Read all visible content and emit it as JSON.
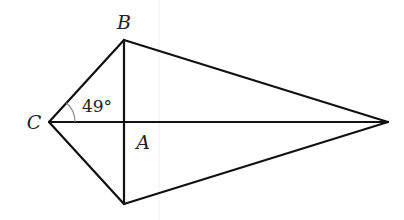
{
  "diagram": {
    "type": "kite",
    "vertices": {
      "B": {
        "label": "B",
        "x": 124,
        "y": 40
      },
      "C": {
        "label": "C",
        "x": 49,
        "y": 122
      },
      "D": {
        "label": "",
        "x": 124,
        "y": 204
      },
      "E": {
        "label": "",
        "x": 388,
        "y": 122
      },
      "A": {
        "label": "A",
        "x": 124,
        "y": 122
      }
    },
    "edges": [
      [
        "C",
        "B"
      ],
      [
        "B",
        "E"
      ],
      [
        "E",
        "D"
      ],
      [
        "D",
        "C"
      ],
      [
        "C",
        "E"
      ],
      [
        "B",
        "D"
      ]
    ],
    "angle": {
      "vertex": "C",
      "between": [
        "A",
        "B"
      ],
      "value": "49°"
    },
    "labels": {
      "B": "B",
      "C": "C",
      "A": "A",
      "angle": "49°"
    },
    "colors": {
      "line": "#111111",
      "arc": "#8a8a8a",
      "text": "#222222",
      "background": "#ffffff"
    }
  }
}
